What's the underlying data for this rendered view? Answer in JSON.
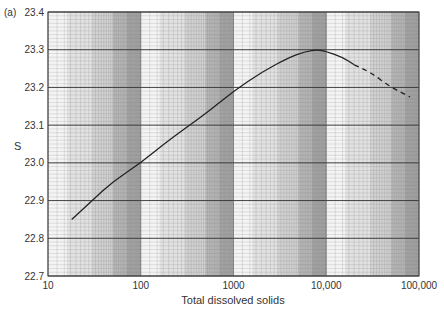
{
  "panel_label": "(a)",
  "chart_data": {
    "type": "line",
    "title": "",
    "xlabel": "Total dissolved solids",
    "ylabel": "S",
    "xscale": "log",
    "xlim": [
      10,
      100000
    ],
    "ylim": [
      22.7,
      23.4
    ],
    "x_ticks": [
      10,
      100,
      1000,
      10000,
      100000
    ],
    "x_tick_labels": [
      "10",
      "100",
      "1000",
      "10,000",
      "100,000"
    ],
    "y_ticks": [
      22.7,
      22.8,
      22.9,
      23.0,
      23.1,
      23.2,
      23.3,
      23.4
    ],
    "y_tick_labels": [
      "22.7",
      "22.8",
      "22.9",
      "23.0",
      "23.1",
      "23.2",
      "23.3",
      "23.4"
    ],
    "grid": true,
    "series": [
      {
        "name": "S (solid)",
        "style": "solid",
        "x": [
          18,
          30,
          50,
          100,
          200,
          500,
          1000,
          2000,
          4000,
          6000,
          8000,
          10000,
          15000,
          20000
        ],
        "y": [
          22.85,
          22.9,
          22.95,
          23.0,
          23.06,
          23.13,
          23.19,
          23.24,
          23.28,
          23.295,
          23.3,
          23.295,
          23.28,
          23.26
        ]
      },
      {
        "name": "S (extrapolated)",
        "style": "dashed",
        "x": [
          20000,
          30000,
          50000,
          80000
        ],
        "y": [
          23.26,
          23.24,
          23.2,
          23.175
        ]
      }
    ]
  }
}
